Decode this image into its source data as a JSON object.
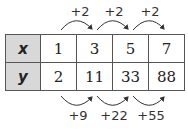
{
  "table": {
    "rows": [
      {
        "label": "x",
        "values": [
          "1",
          "3",
          "5",
          "7"
        ]
      },
      {
        "label": "y",
        "values": [
          "2",
          "11",
          "33",
          "88"
        ]
      }
    ]
  },
  "top_differences": [
    "+2",
    "+2",
    "+2"
  ],
  "bottom_differences": [
    "+9",
    "+22",
    "+55"
  ]
}
